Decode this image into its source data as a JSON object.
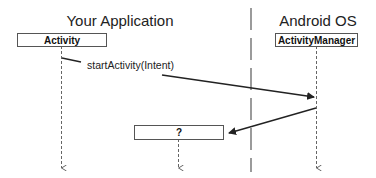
{
  "lanes": {
    "app": {
      "title": "Your Application"
    },
    "os": {
      "title": "Android OS"
    }
  },
  "participants": {
    "activity": {
      "label": "Activity"
    },
    "activity_manager": {
      "label": "ActivityManager"
    },
    "unknown": {
      "label": "?"
    }
  },
  "messages": [
    {
      "label": "startActivity(Intent)",
      "from": "Activity",
      "to": "ActivityManager"
    },
    {
      "label": "",
      "from": "ActivityManager",
      "to": "?"
    }
  ],
  "colors": {
    "line": "#333333",
    "lifeline": "#666666",
    "box_border": "#555555"
  }
}
